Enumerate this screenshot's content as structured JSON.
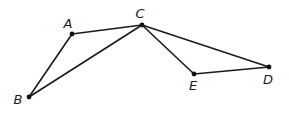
{
  "diagram": {
    "type": "geometry-figure",
    "points": [
      {
        "id": "A",
        "label": "A",
        "x": 72,
        "y": 34,
        "lx": 68,
        "ly": 28
      },
      {
        "id": "B",
        "label": "B",
        "x": 29,
        "y": 97,
        "lx": 18,
        "ly": 104
      },
      {
        "id": "C",
        "label": "C",
        "x": 142,
        "y": 25,
        "lx": 140,
        "ly": 18
      },
      {
        "id": "D",
        "label": "D",
        "x": 269,
        "y": 67,
        "lx": 268,
        "ly": 84
      },
      {
        "id": "E",
        "label": "E",
        "x": 194,
        "y": 74,
        "lx": 193,
        "ly": 90
      }
    ],
    "segments": [
      [
        "A",
        "C"
      ],
      [
        "A",
        "B"
      ],
      [
        "B",
        "C"
      ],
      [
        "C",
        "E"
      ],
      [
        "C",
        "D"
      ],
      [
        "E",
        "D"
      ]
    ]
  }
}
